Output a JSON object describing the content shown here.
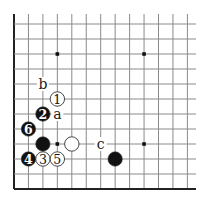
{
  "diagram": {
    "type": "go-board-fragment",
    "view": "lower-left corner",
    "grid": {
      "columns": 13,
      "rows": 12,
      "origin_x": 14,
      "origin_y": 24,
      "spacing_x": 14.45,
      "spacing_y": 15,
      "right_extend": 196,
      "top_extend": 14,
      "line_color": "#8a8a8a",
      "edge_color": "#222222"
    },
    "edges": [
      "left",
      "bottom"
    ],
    "star_points": [
      {
        "col": 3,
        "row": 2
      },
      {
        "col": 9,
        "row": 2
      },
      {
        "col": 3,
        "row": 8
      },
      {
        "col": 9,
        "row": 8
      }
    ],
    "stones": [
      {
        "color": "white",
        "col": 3,
        "row": 5,
        "label": "1"
      },
      {
        "color": "black",
        "col": 2,
        "row": 6,
        "label": "2"
      },
      {
        "color": "white",
        "col": 2,
        "row": 9,
        "label": "3"
      },
      {
        "color": "black",
        "col": 1,
        "row": 9,
        "label": "4"
      },
      {
        "color": "white",
        "col": 3,
        "row": 9,
        "label": "5"
      },
      {
        "color": "black",
        "col": 1,
        "row": 7,
        "label": "6"
      },
      {
        "color": "black",
        "col": 2,
        "row": 8,
        "label": ""
      },
      {
        "color": "white",
        "col": 4,
        "row": 8,
        "label": ""
      },
      {
        "color": "black",
        "col": 7,
        "row": 9,
        "label": ""
      }
    ],
    "letter_marks": [
      {
        "label": "a",
        "col": 3,
        "row": 6
      },
      {
        "label": "b",
        "col": 2,
        "row": 4
      },
      {
        "label": "c",
        "col": 6,
        "row": 8
      }
    ],
    "colors": {
      "black_stone": "#111111",
      "white_stone": "#ffffff",
      "stone_outline": "#333333",
      "background": "#ffffff"
    }
  }
}
